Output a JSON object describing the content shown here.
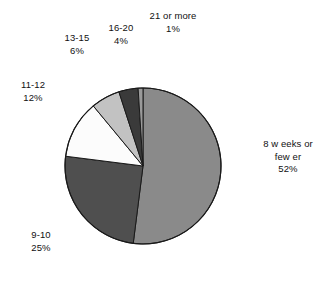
{
  "chart_data": {
    "type": "pie",
    "title": "",
    "subtitle": "",
    "xlabel": "",
    "ylabel": "",
    "legend_position": "none",
    "grid": false,
    "labels_show_percent": true,
    "start_angle_deg": 0,
    "direction": "clockwise",
    "categories": [
      "8 weeks or fewer",
      "9-10",
      "11-12",
      "13-15",
      "16-20",
      "21 or more"
    ],
    "values": [
      52,
      25,
      12,
      6,
      4,
      1
    ],
    "value_unit": "%",
    "slices": [
      {
        "name": "8 weeks or fewer",
        "display_name_line1": "8 w eeks or",
        "display_name_line2": "few er",
        "value": 52,
        "value_label": "52%",
        "color": "#8a8a8a"
      },
      {
        "name": "9-10",
        "display_name_line1": "9-10",
        "display_name_line2": "",
        "value": 25,
        "value_label": "25%",
        "color": "#4f4f4f"
      },
      {
        "name": "11-12",
        "display_name_line1": "11-12",
        "display_name_line2": "",
        "value": 12,
        "value_label": "12%",
        "color": "#fcfcfc"
      },
      {
        "name": "13-15",
        "display_name_line1": "13-15",
        "display_name_line2": "",
        "value": 6,
        "value_label": "6%",
        "color": "#c2c2c2"
      },
      {
        "name": "16-20",
        "display_name_line1": "16-20",
        "display_name_line2": "",
        "value": 4,
        "value_label": "4%",
        "color": "#3a3a3a"
      },
      {
        "name": "21 or more",
        "display_name_line1": "21 or more",
        "display_name_line2": "",
        "value": 1,
        "value_label": "1%",
        "color": "#9a9a9a"
      }
    ]
  },
  "colors": {
    "background": "#ffffff",
    "outline": "#1a1a1a",
    "text": "#111111"
  }
}
